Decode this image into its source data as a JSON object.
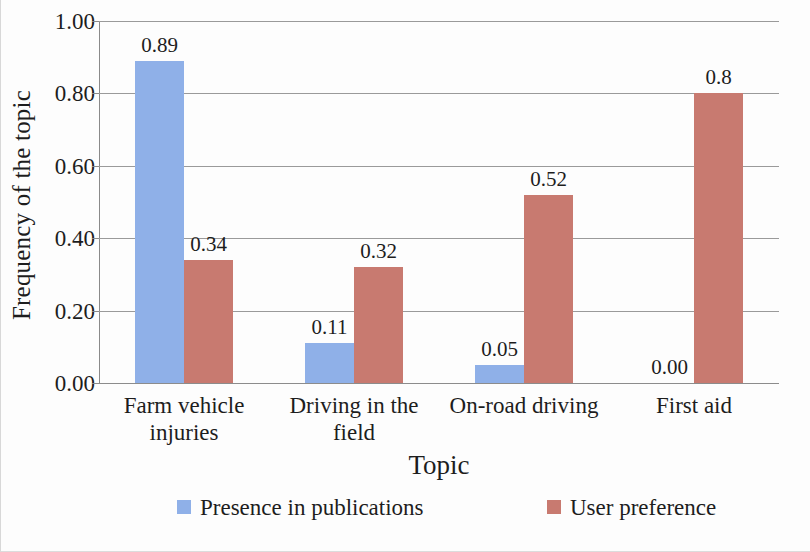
{
  "chart_data": {
    "type": "bar",
    "title": "",
    "xlabel": "Topic",
    "ylabel": "Frequency of the topic",
    "ylim": [
      0,
      1.0
    ],
    "ytick_labels": [
      "1.00",
      "0.80",
      "0.60",
      "0.40",
      "0.20",
      "0.00"
    ],
    "ytick_values": [
      1.0,
      0.8,
      0.6,
      0.4,
      0.2,
      0.0
    ],
    "grid": true,
    "legend_position": "bottom",
    "categories": [
      "Farm vehicle injuries",
      "Driving in the field",
      "On-road driving",
      "First aid"
    ],
    "category_lines": [
      [
        "Farm vehicle",
        "injuries"
      ],
      [
        "Driving in the",
        "field"
      ],
      [
        "On-road driving"
      ],
      [
        "First aid"
      ]
    ],
    "series": [
      {
        "name": "Presence in publications",
        "color": "#8fb0e8",
        "values": [
          0.89,
          0.11,
          0.05,
          0.0
        ],
        "data_labels": [
          "0.89",
          "0.11",
          "0.05",
          "0.00"
        ]
      },
      {
        "name": "User preference",
        "color": "#c87a70",
        "values": [
          0.34,
          0.32,
          0.52,
          0.8
        ],
        "data_labels": [
          "0.34",
          "0.32",
          "0.52",
          "0.8"
        ]
      }
    ]
  },
  "axes": {
    "y_title": "Frequency of the topic",
    "x_title": "Topic"
  },
  "legend": {
    "items": [
      {
        "label": "Presence in publications",
        "color": "#8fb0e8"
      },
      {
        "label": "User preference",
        "color": "#c87a70"
      }
    ]
  }
}
